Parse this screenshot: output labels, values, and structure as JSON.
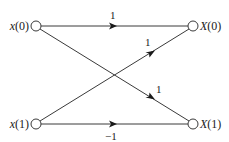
{
  "diagram": {
    "type": "butterfly-signal-flow-graph",
    "nodes": {
      "in0": {
        "label": "x(0)",
        "label_func": "x",
        "label_arg": "(0)"
      },
      "in1": {
        "label": "x(1)",
        "label_func": "x",
        "label_arg": "(1)"
      },
      "out0": {
        "label": "X(0)",
        "label_func": "X",
        "label_arg": "(0)"
      },
      "out1": {
        "label": "X(1)",
        "label_func": "X",
        "label_arg": "(1)"
      }
    },
    "edges": [
      {
        "from": "x(0)",
        "to": "X(0)",
        "weight": "1"
      },
      {
        "from": "x(1)",
        "to": "X(0)",
        "weight": "1"
      },
      {
        "from": "x(0)",
        "to": "X(1)",
        "weight": "1"
      },
      {
        "from": "x(1)",
        "to": "X(1)",
        "weight": "−1"
      }
    ]
  }
}
